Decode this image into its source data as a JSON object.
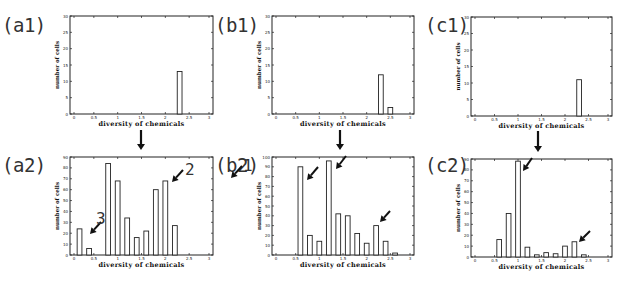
{
  "panels": {
    "a1": {
      "label": "(a1)"
    },
    "a2": {
      "label": "(a2)"
    },
    "b1": {
      "label": "(b1)"
    },
    "b2": {
      "label": "(b2)"
    },
    "c1": {
      "label": "(c1)"
    },
    "c2": {
      "label": "(c2)"
    }
  },
  "annotations": {
    "a2_1": "1",
    "a2_2": "2",
    "a2_3": "3"
  },
  "axis": {
    "xlabel": "diversity of chemicals",
    "ylabel": "number of cells"
  },
  "chart_data": [
    {
      "id": "a1",
      "type": "bar",
      "title": "(a1)",
      "xlabel": "diversity of chemicals",
      "ylabel": "number of cells",
      "xlim": [
        0,
        3
      ],
      "ylim": [
        0,
        30
      ],
      "xticks": [
        0,
        0.5,
        1,
        1.5,
        2,
        2.5,
        3
      ],
      "yticks": [
        0,
        5,
        10,
        15,
        20,
        25,
        30
      ],
      "bins": [
        {
          "x": 2.3,
          "width": 0.1,
          "value": 13
        }
      ]
    },
    {
      "id": "a2",
      "type": "bar",
      "title": "(a2)",
      "xlabel": "diversity of chemicals",
      "ylabel": "number of cells",
      "xlim": [
        0,
        3
      ],
      "ylim": [
        0,
        90
      ],
      "xticks": [
        0,
        0.5,
        1,
        1.5,
        2,
        2.5,
        3
      ],
      "yticks": [
        0,
        10,
        20,
        30,
        40,
        50,
        60,
        70,
        80,
        90
      ],
      "bins": [
        {
          "x": 0.2,
          "width": 0.1,
          "value": 24
        },
        {
          "x": 0.4,
          "width": 0.1,
          "value": 6
        },
        {
          "x": 0.8,
          "width": 0.1,
          "value": 84
        },
        {
          "x": 1.0,
          "width": 0.1,
          "value": 68
        },
        {
          "x": 1.2,
          "width": 0.1,
          "value": 34
        },
        {
          "x": 1.4,
          "width": 0.1,
          "value": 16
        },
        {
          "x": 1.6,
          "width": 0.1,
          "value": 22
        },
        {
          "x": 1.8,
          "width": 0.1,
          "value": 60
        },
        {
          "x": 2.0,
          "width": 0.1,
          "value": 68
        },
        {
          "x": 2.2,
          "width": 0.1,
          "value": 27
        }
      ],
      "annotations": [
        {
          "text": "1",
          "points_to_x": 2.0
        },
        {
          "text": "2",
          "points_to_x": 1.0
        },
        {
          "text": "3",
          "points_to_x": 0.3
        }
      ]
    },
    {
      "id": "b1",
      "type": "bar",
      "title": "(b1)",
      "xlabel": "diversity of chemicals",
      "ylabel": "number of cells",
      "xlim": [
        0,
        3
      ],
      "ylim": [
        0,
        30
      ],
      "xticks": [
        0,
        0.5,
        1,
        1.5,
        2,
        2.5,
        3
      ],
      "yticks": [
        0,
        5,
        10,
        15,
        20,
        25,
        30
      ],
      "bins": [
        {
          "x": 2.3,
          "width": 0.1,
          "value": 12
        },
        {
          "x": 2.5,
          "width": 0.1,
          "value": 2
        }
      ]
    },
    {
      "id": "b2",
      "type": "bar",
      "title": "(b2)",
      "xlabel": "diversity of chemicals",
      "ylabel": "number of cells",
      "xlim": [
        0,
        3
      ],
      "ylim": [
        0,
        100
      ],
      "xticks": [
        0,
        0.5,
        1,
        1.5,
        2,
        2.5,
        3
      ],
      "yticks": [
        0,
        10,
        20,
        30,
        40,
        50,
        60,
        70,
        80,
        90,
        100
      ],
      "bins": [
        {
          "x": 0.6,
          "width": 0.1,
          "value": 90
        },
        {
          "x": 0.8,
          "width": 0.1,
          "value": 20
        },
        {
          "x": 1.0,
          "width": 0.1,
          "value": 14
        },
        {
          "x": 1.2,
          "width": 0.1,
          "value": 96
        },
        {
          "x": 1.4,
          "width": 0.1,
          "value": 42
        },
        {
          "x": 1.6,
          "width": 0.1,
          "value": 40
        },
        {
          "x": 1.8,
          "width": 0.1,
          "value": 22
        },
        {
          "x": 2.0,
          "width": 0.1,
          "value": 12
        },
        {
          "x": 2.2,
          "width": 0.1,
          "value": 30
        },
        {
          "x": 2.4,
          "width": 0.1,
          "value": 14
        },
        {
          "x": 2.6,
          "width": 0.1,
          "value": 2
        }
      ],
      "annotations": [
        {
          "text": "arrow",
          "points_to_x": 0.7
        },
        {
          "text": "arrow",
          "points_to_x": 1.3
        },
        {
          "text": "arrow",
          "points_to_x": 2.3
        }
      ]
    },
    {
      "id": "c1",
      "type": "bar",
      "title": "(c1)",
      "xlabel": "diversity of chemicals",
      "ylabel": "number of cells",
      "xlim": [
        0,
        3
      ],
      "ylim": [
        0,
        30
      ],
      "xticks": [
        0,
        0.5,
        1,
        1.5,
        2,
        2.5,
        3
      ],
      "yticks": [
        0,
        5,
        10,
        15,
        20,
        25,
        30
      ],
      "bins": [
        {
          "x": 2.3,
          "width": 0.1,
          "value": 11
        }
      ]
    },
    {
      "id": "c2",
      "type": "bar",
      "title": "(c2)",
      "xlabel": "diversity of chemicals",
      "ylabel": "number of cells",
      "xlim": [
        0,
        3
      ],
      "ylim": [
        0,
        90
      ],
      "xticks": [
        0,
        0.5,
        1,
        1.5,
        2,
        2.5,
        3
      ],
      "yticks": [
        0,
        10,
        20,
        30,
        40,
        50,
        60,
        70,
        80,
        90
      ],
      "bins": [
        {
          "x": 0.6,
          "width": 0.1,
          "value": 16
        },
        {
          "x": 0.8,
          "width": 0.1,
          "value": 40
        },
        {
          "x": 1.0,
          "width": 0.1,
          "value": 88
        },
        {
          "x": 1.2,
          "width": 0.1,
          "value": 9
        },
        {
          "x": 1.4,
          "width": 0.1,
          "value": 2
        },
        {
          "x": 1.6,
          "width": 0.1,
          "value": 4
        },
        {
          "x": 1.8,
          "width": 0.1,
          "value": 3
        },
        {
          "x": 2.0,
          "width": 0.1,
          "value": 10
        },
        {
          "x": 2.2,
          "width": 0.1,
          "value": 14
        },
        {
          "x": 2.4,
          "width": 0.1,
          "value": 2
        }
      ],
      "annotations": [
        {
          "text": "arrow",
          "points_to_x": 1.05
        },
        {
          "text": "arrow",
          "points_to_x": 2.3
        }
      ]
    }
  ]
}
